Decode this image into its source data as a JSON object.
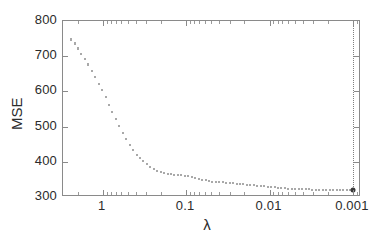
{
  "chart_data": {
    "type": "scatter",
    "title": "",
    "xlabel": "λ",
    "ylabel": "MSE",
    "xscale": "log-reversed",
    "xlim": [
      3.0,
      0.0008
    ],
    "ylim": [
      300,
      800
    ],
    "grid": false,
    "legend": null,
    "xticks": [
      {
        "value": 1,
        "label": "1"
      },
      {
        "value": 0.1,
        "label": "0.1"
      },
      {
        "value": 0.01,
        "label": "0.01"
      },
      {
        "value": 0.001,
        "label": "0.001"
      }
    ],
    "yticks": [
      {
        "value": 800,
        "label": "800"
      },
      {
        "value": 700,
        "label": "700"
      },
      {
        "value": 600,
        "label": "600"
      },
      {
        "value": 500,
        "label": "500"
      },
      {
        "value": 400,
        "label": "400"
      },
      {
        "value": 300,
        "label": "300"
      }
    ],
    "marker": "errorbar-tick",
    "marker_color": "#555555",
    "selected_point": {
      "lambda": 0.001,
      "mse": 320,
      "marker": "filled-circle",
      "color": "#3a3a3a",
      "guide_line": "dotted-vertical"
    },
    "x": [
      2.4,
      2.18,
      1.98,
      1.8,
      1.64,
      1.49,
      1.35,
      1.23,
      1.12,
      1.02,
      0.925,
      0.841,
      0.765,
      0.695,
      0.632,
      0.575,
      0.523,
      0.475,
      0.432,
      0.393,
      0.357,
      0.325,
      0.295,
      0.268,
      0.244,
      0.222,
      0.202,
      0.183,
      0.167,
      0.152,
      0.138,
      0.125,
      0.114,
      0.104,
      0.0942,
      0.0857,
      0.0779,
      0.0708,
      0.0644,
      0.0586,
      0.0532,
      0.0484,
      0.044,
      0.04,
      0.0364,
      0.0331,
      0.0301,
      0.0273,
      0.0249,
      0.0226,
      0.0206,
      0.0187,
      0.017,
      0.0154,
      0.014,
      0.0128,
      0.0116,
      0.0105,
      0.00958,
      0.00871,
      0.00792,
      0.0072,
      0.00655,
      0.00595,
      0.00541,
      0.00492,
      0.00447,
      0.00407,
      0.0037,
      0.00336,
      0.00306,
      0.00278,
      0.00253,
      0.0023,
      0.00209,
      0.0019,
      0.00173,
      0.00157,
      0.00143,
      0.0013,
      0.00118,
      0.00107,
      0.001
    ],
    "y": [
      748,
      736,
      722,
      707,
      692,
      676,
      659,
      641,
      622,
      603,
      583,
      562,
      541,
      521,
      501,
      482,
      464,
      448,
      433,
      420,
      410,
      401,
      393,
      386,
      380,
      375,
      371,
      368,
      366,
      364,
      363,
      362,
      362,
      361,
      360,
      358,
      355,
      352,
      349,
      347,
      345,
      344,
      343,
      343,
      342,
      341,
      340,
      339,
      338,
      337,
      336,
      335,
      334,
      333,
      332,
      331,
      330,
      329,
      328,
      327,
      326,
      326,
      325,
      324,
      324,
      323,
      323,
      322,
      322,
      322,
      321,
      321,
      321,
      320,
      320,
      320,
      320,
      320,
      320,
      320,
      320,
      320,
      320
    ],
    "yerr": [
      3.5,
      3.5,
      3.4,
      3.4,
      3.3,
      3.3,
      3.2,
      3.2,
      3.1,
      3.0,
      3.0,
      2.9,
      2.8,
      2.8,
      2.7,
      2.6,
      2.5,
      2.5,
      2.4,
      2.3,
      2.2,
      2.2,
      2.1,
      2.0,
      2.0,
      1.9,
      1.9,
      1.8,
      1.8,
      1.8,
      1.8,
      1.7,
      1.7,
      1.7,
      1.7,
      1.7,
      1.6,
      1.6,
      1.6,
      1.6,
      1.6,
      1.5,
      1.5,
      1.5,
      1.5,
      1.5,
      1.5,
      1.5,
      1.4,
      1.4,
      1.4,
      1.4,
      1.4,
      1.4,
      1.4,
      1.4,
      1.3,
      1.3,
      1.3,
      1.3,
      1.3,
      1.3,
      1.3,
      1.3,
      1.3,
      1.3,
      1.2,
      1.2,
      1.2,
      1.2,
      1.2,
      1.2,
      1.2,
      1.2,
      1.2,
      1.2,
      1.2,
      1.2,
      1.2,
      1.2,
      1.2,
      1.2,
      1.2
    ]
  }
}
